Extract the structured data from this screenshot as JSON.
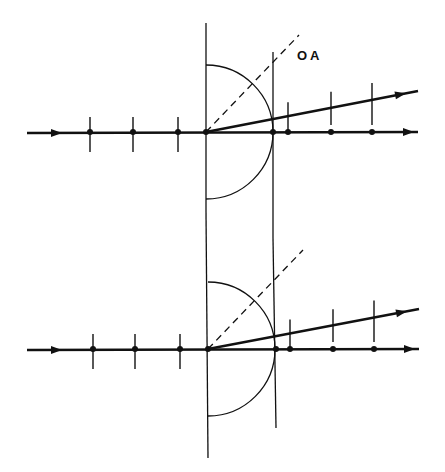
{
  "diagram": {
    "label_oa": "OA",
    "stroke_color": "#111111",
    "background": "#ffffff",
    "panels": [
      {
        "name": "top",
        "axis_y": 132,
        "origin_x": 206,
        "second_vertical_x": 273,
        "radius": 67,
        "left_ticks_x": [
          90,
          133,
          178
        ],
        "axis_dots_x": [
          288,
          331,
          372
        ],
        "tilted_end": [
          418,
          91
        ],
        "dashed_end": [
          299,
          35
        ],
        "axis_end_x": 418
      },
      {
        "name": "bottom",
        "axis_y": 349,
        "origin_x": 208,
        "second_vertical_x": 276,
        "radius": 67,
        "left_ticks_x": [
          93,
          135,
          180
        ],
        "axis_dots_x": [
          290,
          333,
          374
        ],
        "tilted_end": [
          419,
          309
        ],
        "dashed_end": [
          303,
          250
        ],
        "axis_end_x": 419
      }
    ]
  }
}
